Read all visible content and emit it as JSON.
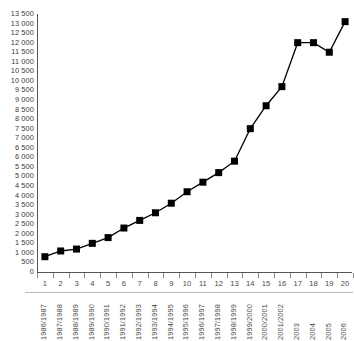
{
  "chart_data": {
    "type": "line",
    "title": "",
    "subtitle": "",
    "xlabel": "",
    "ylabel": "",
    "grid": false,
    "legend": "none",
    "marker": "square",
    "line_color": "#000000",
    "marker_color": "#000000",
    "axis_color": "#555555",
    "background": "#ffffff",
    "ylim": [
      0,
      13500
    ],
    "ytick_step": 500,
    "ytick_labels": [
      "13 500",
      "13 000",
      "12 500",
      "12 000",
      "11 500",
      "11 000",
      "10 500",
      "10 000",
      "9 500",
      "9 000",
      "8 500",
      "8 000",
      "7 500",
      "7 000",
      "6 500",
      "6 000",
      "5 500",
      "5 000",
      "4 500",
      "4 000",
      "3 500",
      "3 000",
      "2 500",
      "2 000",
      "1 500",
      "1 000",
      "500",
      "0"
    ],
    "ytick_values": [
      13500,
      13000,
      12500,
      12000,
      11500,
      11000,
      10500,
      10000,
      9500,
      9000,
      8500,
      8000,
      7500,
      7000,
      6500,
      6000,
      5500,
      5000,
      4500,
      4000,
      3500,
      3000,
      2500,
      2000,
      1500,
      1000,
      500,
      0
    ],
    "x_index_labels": [
      "1",
      "2",
      "3",
      "4",
      "5",
      "6",
      "7",
      "8",
      "9",
      "10",
      "11",
      "12",
      "13",
      "14",
      "15",
      "16",
      "17",
      "18",
      "19",
      "20"
    ],
    "categories": [
      "1986/1987",
      "1987/1988",
      "1988/1989",
      "1989/1990",
      "1990/1991",
      "1991/1992",
      "1992/1993",
      "1993/1994",
      "1994/1995",
      "1995/1996",
      "1996/1997",
      "1997/1998",
      "1998/1999",
      "1999/2000",
      "2000/2001",
      "2001/2002",
      "2003",
      "2004",
      "2005",
      "2006"
    ],
    "values": [
      800,
      1100,
      1200,
      1500,
      1800,
      2300,
      2700,
      3100,
      3600,
      4200,
      4700,
      5200,
      5800,
      7500,
      8700,
      9700,
      12000,
      12000,
      11500,
      13100
    ]
  }
}
